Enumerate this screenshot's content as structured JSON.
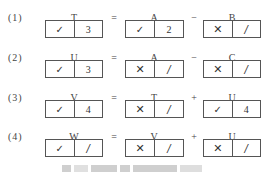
{
  "rows": [
    {
      "label": "(1)",
      "lhs": {
        "var": "T",
        "mark": "✓",
        "value": "3"
      },
      "eq": "=",
      "a": {
        "var": "A",
        "mark": "✓",
        "value": "2"
      },
      "op": "−",
      "b": {
        "var": "B",
        "mark": "✕",
        "value": "/"
      }
    },
    {
      "label": "(2)",
      "lhs": {
        "var": "U",
        "mark": "✓",
        "value": "3"
      },
      "eq": "=",
      "a": {
        "var": "A",
        "mark": "✕",
        "value": "/"
      },
      "op": "−",
      "b": {
        "var": "C",
        "mark": "✕",
        "value": "/"
      }
    },
    {
      "label": "(3)",
      "lhs": {
        "var": "V",
        "mark": "✓",
        "value": "4"
      },
      "eq": "=",
      "a": {
        "var": "T",
        "mark": "✕",
        "value": "/"
      },
      "op": "+",
      "b": {
        "var": "U",
        "mark": "✓",
        "value": "4"
      }
    },
    {
      "label": "(4)",
      "lhs": {
        "var": "W",
        "mark": "✓",
        "value": "/"
      },
      "eq": "=",
      "a": {
        "var": "V",
        "mark": "✕",
        "value": "/"
      },
      "op": "+",
      "b": {
        "var": "U",
        "mark": "✕",
        "value": "/"
      }
    }
  ],
  "caption": {
    "visible": true,
    "legible": false
  }
}
